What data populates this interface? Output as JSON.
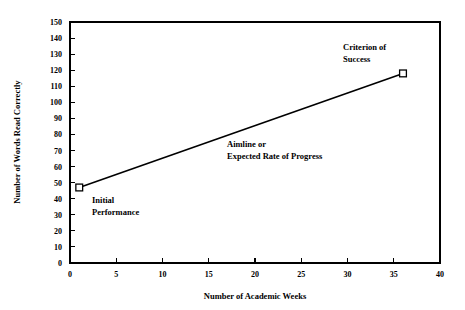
{
  "chart_data": {
    "type": "line",
    "title": "",
    "subtitle": "",
    "xlabel": "Number of Academic Weeks",
    "ylabel": "Number of Words Read Correctly",
    "xlim": [
      0,
      40
    ],
    "ylim": [
      0,
      150
    ],
    "grid": false,
    "legend": "none",
    "x_ticks": [
      0,
      5,
      10,
      15,
      20,
      25,
      30,
      35,
      40
    ],
    "x_tick_labels": [
      "0",
      "5",
      "10",
      "15",
      "20",
      "25",
      "30",
      "35",
      "40"
    ],
    "y_ticks": [
      0,
      10,
      20,
      30,
      40,
      50,
      60,
      70,
      80,
      90,
      100,
      110,
      120,
      130,
      140,
      150
    ],
    "y_tick_labels": [
      "0",
      "10",
      "20",
      "30",
      "40",
      "50",
      "60",
      "70",
      "80",
      "90",
      "100",
      "110",
      "120",
      "130",
      "140",
      "150"
    ],
    "series": [
      {
        "name": "Aimline or Expected Rate of Progress",
        "marker": "open-square",
        "color": "#000000",
        "x": [
          1,
          36
        ],
        "values": [
          47,
          118
        ],
        "points": [
          {
            "x": 1,
            "y": 47,
            "label": "Initial Performance"
          },
          {
            "x": 36,
            "y": 118,
            "label": "Criterion of Success"
          }
        ]
      }
    ],
    "annotations": [
      {
        "name": "initial-performance",
        "lines": [
          "Initial",
          "Performance"
        ],
        "x": 1.5,
        "y": 38,
        "anchor": "start"
      },
      {
        "name": "aimline",
        "lines": [
          "Aimline or",
          "Expected Rate of Progress"
        ],
        "x": 18.5,
        "y": 73,
        "anchor": "start"
      },
      {
        "name": "criterion-of-success",
        "lines": [
          "Criterion of",
          "Success"
        ],
        "x": 29.5,
        "y": 133,
        "anchor": "start"
      }
    ]
  },
  "axes": {
    "x_title": "Number of Academic Weeks",
    "y_title": "Number of Words Read Correctly"
  },
  "ticks": {
    "x": [
      "0",
      "5",
      "10",
      "15",
      "20",
      "25",
      "30",
      "35",
      "40"
    ],
    "y": [
      "0",
      "10",
      "20",
      "30",
      "40",
      "50",
      "60",
      "70",
      "80",
      "90",
      "100",
      "110",
      "120",
      "130",
      "140",
      "150"
    ]
  },
  "annotations": {
    "initial": {
      "line1": "Initial",
      "line2": "Performance"
    },
    "aimline": {
      "line1": "Aimline or",
      "line2": "Expected Rate of Progress"
    },
    "criterion": {
      "line1": "Criterion of",
      "line2": "Success"
    }
  },
  "colors": {
    "background": "#ffffff",
    "ink": "#000000",
    "marker_fill": "#ffffff"
  }
}
